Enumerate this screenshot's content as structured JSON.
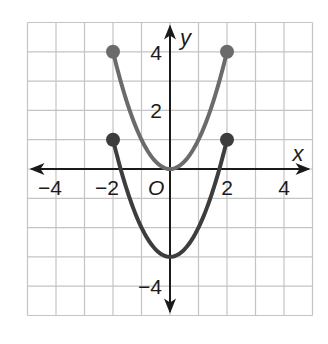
{
  "chart_data": {
    "type": "line",
    "title": "",
    "xlabel": "x",
    "ylabel": "y",
    "origin_label": "O",
    "xlim": [
      -5,
      5
    ],
    "ylim": [
      -5,
      5
    ],
    "grid": true,
    "grid_step": 1,
    "x_ticks": [
      {
        "value": -4,
        "label": "−4"
      },
      {
        "value": -2,
        "label": "−2"
      },
      {
        "value": 2,
        "label": "2"
      },
      {
        "value": 4,
        "label": "4"
      }
    ],
    "y_ticks": [
      {
        "value": 4,
        "label": "4"
      },
      {
        "value": 2,
        "label": "2"
      },
      {
        "value": -4,
        "label": "−4"
      }
    ],
    "series": [
      {
        "name": "upper parabola",
        "equation": "y = x^2",
        "domain": [
          -2,
          2
        ],
        "color": "#6b6b6b",
        "points": [
          [
            -2,
            4
          ],
          [
            -1,
            1
          ],
          [
            0,
            0
          ],
          [
            1,
            1
          ],
          [
            2,
            4
          ]
        ],
        "endpoints": [
          [
            -2,
            4
          ],
          [
            2,
            4
          ]
        ],
        "endpoint_style": "closed"
      },
      {
        "name": "lower parabola",
        "equation": "y = x^2 - 3",
        "domain": [
          -2,
          2
        ],
        "color": "#3d3d3d",
        "points": [
          [
            -2,
            1
          ],
          [
            -1,
            -2
          ],
          [
            0,
            -3
          ],
          [
            1,
            -2
          ],
          [
            2,
            1
          ]
        ],
        "endpoints": [
          [
            -2,
            1
          ],
          [
            2,
            1
          ]
        ],
        "endpoint_style": "closed"
      }
    ]
  },
  "colors": {
    "grid": "#c4c4c4",
    "axis": "#1a1a1a",
    "background": "#ffffff"
  }
}
